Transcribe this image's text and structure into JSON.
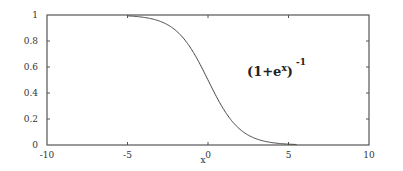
{
  "chart_data": {
    "type": "line",
    "title": "",
    "xlabel": "x",
    "ylabel": "",
    "xlim": [
      -10,
      10
    ],
    "ylim": [
      0,
      1
    ],
    "x_ticks": [
      -10,
      -5,
      0,
      5,
      10
    ],
    "x_tick_labels": [
      "-10",
      "-5",
      "0",
      "5",
      "10"
    ],
    "y_ticks": [
      0,
      0.2,
      0.4,
      0.6,
      0.8,
      1
    ],
    "y_tick_labels": [
      "0",
      "0.2",
      "0.4",
      "0.6",
      "0.8",
      "1"
    ],
    "grid": false,
    "legend": null,
    "series": [
      {
        "name": "(1+e^x)^-1",
        "function": "1/(1+exp(x))",
        "x_range_drawn": [
          -5,
          5.5
        ],
        "x": [
          -5,
          -4,
          -3,
          -2,
          -1,
          0,
          1,
          2,
          3,
          4,
          5,
          5.5
        ],
        "y": [
          0.993,
          0.982,
          0.953,
          0.881,
          0.731,
          0.5,
          0.269,
          0.119,
          0.047,
          0.018,
          0.007,
          0.004
        ]
      }
    ],
    "annotations": [
      {
        "text": "(1+e",
        "sup_inner": "x",
        "close": ")",
        "sup_outer": "-1",
        "x": 1.0,
        "y": 0.55
      }
    ]
  },
  "colors": {
    "frame": "#555555",
    "curve": "#444444",
    "text": "#333333",
    "background": "#ffffff"
  }
}
